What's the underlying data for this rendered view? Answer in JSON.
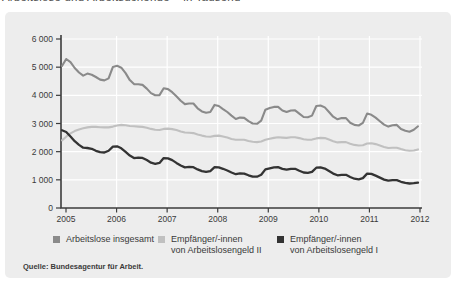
{
  "page": {
    "clipped_title": "Arbeitslose und Arbeitsuchende – in Tausend",
    "source": "Quelle: Bundesagentur für Arbeit."
  },
  "legend": [
    {
      "label_line1": "Arbeitslose insgesamt",
      "label_line2": "",
      "color": "#8a8a8a"
    },
    {
      "label_line1": "Empfänger/-innen",
      "label_line2": "von Arbeitslosengeld II",
      "color": "#c0c0c0"
    },
    {
      "label_line1": "Empfänger/-innen",
      "label_line2": "von Arbeitslosengeld I",
      "color": "#333333"
    }
  ],
  "colors": {
    "panel_bg": "#ededed",
    "grid": "#ffffff",
    "axis": "#3c3c3c"
  },
  "chart_data": {
    "type": "line",
    "title": "Arbeitslose und Arbeitsuchende – in Tausend",
    "xlabel": "",
    "ylabel": "in Tausend",
    "x_unit": "month",
    "x_start_year": 2005,
    "x_end_year": 2012,
    "x_tick_labels": [
      "2005",
      "2006",
      "2007",
      "2008",
      "2009",
      "2010",
      "2011",
      "2012"
    ],
    "y_ticks": [
      0,
      1000,
      2000,
      3000,
      4000,
      5000,
      6000
    ],
    "y_tick_labels": [
      "0",
      "1 000",
      "2 000",
      "3 000",
      "4 000",
      "5 000",
      "6 000"
    ],
    "ylim": [
      0,
      6000
    ],
    "grid": true,
    "legend_position": "bottom",
    "series": [
      {
        "name": "Arbeitslose insgesamt",
        "color": "#8a8a8a",
        "width": 2.1,
        "values": [
          5040,
          5290,
          5180,
          4970,
          4810,
          4700,
          4770,
          4730,
          4650,
          4560,
          4530,
          4600,
          5010,
          5050,
          4980,
          4790,
          4540,
          4400,
          4390,
          4370,
          4240,
          4080,
          4000,
          4010,
          4250,
          4220,
          4110,
          3970,
          3810,
          3690,
          3710,
          3710,
          3540,
          3430,
          3380,
          3410,
          3660,
          3620,
          3510,
          3410,
          3280,
          3160,
          3210,
          3200,
          3080,
          3000,
          2990,
          3100,
          3490,
          3550,
          3590,
          3590,
          3460,
          3410,
          3460,
          3470,
          3350,
          3230,
          3220,
          3280,
          3620,
          3640,
          3570,
          3410,
          3240,
          3150,
          3190,
          3190,
          3030,
          2950,
          2930,
          3020,
          3350,
          3310,
          3210,
          3080,
          2960,
          2890,
          2940,
          2950,
          2800,
          2740,
          2710,
          2780,
          2900
        ]
      },
      {
        "name": "Empfänger/-innen von Arbeitslosengeld II",
        "color": "#c0c0c0",
        "width": 2.1,
        "values": [
          2400,
          2530,
          2650,
          2730,
          2790,
          2830,
          2860,
          2880,
          2880,
          2870,
          2860,
          2860,
          2890,
          2930,
          2950,
          2940,
          2910,
          2900,
          2890,
          2880,
          2850,
          2810,
          2780,
          2770,
          2810,
          2820,
          2800,
          2770,
          2720,
          2680,
          2670,
          2660,
          2610,
          2570,
          2540,
          2530,
          2560,
          2570,
          2540,
          2500,
          2450,
          2420,
          2420,
          2420,
          2380,
          2350,
          2340,
          2360,
          2420,
          2460,
          2490,
          2510,
          2500,
          2490,
          2510,
          2510,
          2480,
          2440,
          2420,
          2430,
          2470,
          2490,
          2480,
          2430,
          2370,
          2330,
          2340,
          2340,
          2280,
          2240,
          2220,
          2230,
          2290,
          2300,
          2270,
          2220,
          2170,
          2130,
          2140,
          2140,
          2090,
          2050,
          2030,
          2040,
          2080
        ]
      },
      {
        "name": "Empfänger/-innen von Arbeitslosengeld I",
        "color": "#333333",
        "width": 2.3,
        "values": [
          2760,
          2700,
          2540,
          2370,
          2240,
          2140,
          2130,
          2100,
          2030,
          1980,
          1970,
          2030,
          2180,
          2190,
          2120,
          1990,
          1860,
          1770,
          1790,
          1780,
          1700,
          1610,
          1570,
          1600,
          1770,
          1760,
          1700,
          1600,
          1510,
          1440,
          1460,
          1450,
          1370,
          1310,
          1280,
          1310,
          1450,
          1440,
          1390,
          1330,
          1260,
          1200,
          1230,
          1220,
          1160,
          1110,
          1110,
          1180,
          1370,
          1410,
          1440,
          1450,
          1390,
          1360,
          1390,
          1390,
          1320,
          1260,
          1250,
          1280,
          1430,
          1440,
          1400,
          1310,
          1220,
          1160,
          1180,
          1180,
          1100,
          1040,
          1020,
          1060,
          1220,
          1210,
          1150,
          1080,
          1010,
          970,
          990,
          990,
          930,
          890,
          870,
          880,
          900
        ]
      }
    ]
  }
}
